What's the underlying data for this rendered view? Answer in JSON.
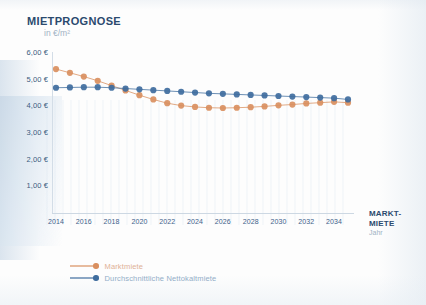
{
  "header": {
    "title": "MIETPROGNOSE",
    "subtitle": "in €/m²"
  },
  "right_label": {
    "line1": "MARKT-",
    "line2": "MIETE",
    "axis_name": "Jahr"
  },
  "legend": {
    "items": [
      {
        "label": "Marktmiete",
        "color": "#d98f5f"
      },
      {
        "label": "Durchschnittliche Nettokaltmiete",
        "color": "#3f6d9e"
      }
    ]
  },
  "chart_data": {
    "type": "line",
    "title": "MIETPROGNOSE",
    "subtitle": "in €/m²",
    "xlabel": "Jahr",
    "ylabel": "in €/m²",
    "grid": false,
    "legend_position": "bottom-left",
    "ylim": [
      0,
      6.0
    ],
    "ytick_values": [
      6.0,
      5.0,
      4.0,
      3.0,
      2.0,
      1.0
    ],
    "ytick_labels": [
      "6,00 €",
      "5,00 €",
      "4,00 €",
      "3,00 €",
      "2,00 €",
      "1,00 €"
    ],
    "x": [
      2014,
      2015,
      2016,
      2017,
      2018,
      2019,
      2020,
      2021,
      2022,
      2023,
      2024,
      2025,
      2026,
      2027,
      2028,
      2029,
      2030,
      2031,
      2032,
      2033,
      2034,
      2035
    ],
    "xtick_labels": [
      "2014",
      "2016",
      "2018",
      "2020",
      "2022",
      "2024",
      "2026",
      "2028",
      "2030",
      "2032",
      "2034"
    ],
    "xtick_values": [
      2014,
      2016,
      2018,
      2020,
      2022,
      2024,
      2026,
      2028,
      2030,
      2032,
      2034
    ],
    "series": [
      {
        "name": "Marktmiete",
        "color": "#d98f5f",
        "values": [
          5.36,
          5.22,
          5.08,
          4.92,
          4.74,
          4.56,
          4.38,
          4.22,
          4.08,
          3.99,
          3.94,
          3.91,
          3.9,
          3.91,
          3.93,
          3.96,
          4.0,
          4.03,
          4.07,
          4.1,
          4.13,
          4.1
        ]
      },
      {
        "name": "Durchschnittliche Nettokaltmiete",
        "color": "#3f6d9e",
        "values": [
          4.66,
          4.67,
          4.68,
          4.68,
          4.66,
          4.63,
          4.6,
          4.57,
          4.54,
          4.51,
          4.48,
          4.45,
          4.43,
          4.41,
          4.39,
          4.37,
          4.35,
          4.33,
          4.31,
          4.29,
          4.27,
          4.22
        ]
      }
    ]
  }
}
